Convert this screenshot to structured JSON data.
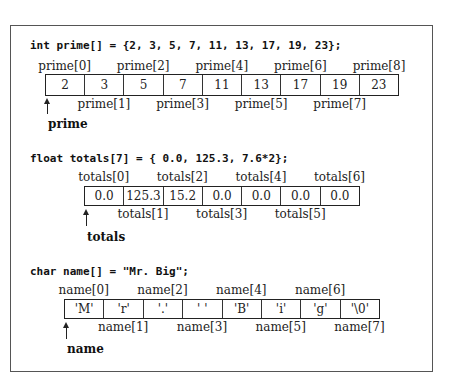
{
  "figure": {
    "sections": [
      {
        "code": "int prime[] = {2, 3, 5, 7, 11, 13, 17, 19, 23};",
        "pointer_name": "prime",
        "values": [
          "2",
          "3",
          "5",
          "7",
          "11",
          "13",
          "17",
          "19",
          "23"
        ],
        "labels": [
          "prime[0]",
          "prime[1]",
          "prime[2]",
          "prime[3]",
          "prime[4]",
          "prime[5]",
          "prime[6]",
          "prime[7]",
          "prime[8]"
        ]
      },
      {
        "code": "float totals[7] = { 0.0, 125.3, 7.6*2};",
        "pointer_name": "totals",
        "values": [
          "0.0",
          "125.3",
          "15.2",
          "0.0",
          "0.0",
          "0.0",
          "0.0"
        ],
        "labels": [
          "totals[0]",
          "totals[1]",
          "totals[2]",
          "totals[3]",
          "totals[4]",
          "totals[5]",
          "totals[6]"
        ]
      },
      {
        "code": "char name[] = \"Mr. Big\";",
        "pointer_name": "name",
        "values": [
          "'M'",
          "'r'",
          "'.'",
          "' '",
          "'B'",
          "'i'",
          "'g'",
          "'\\0'"
        ],
        "labels": [
          "name[0]",
          "name[1]",
          "name[2]",
          "name[3]",
          "name[4]",
          "name[5]",
          "name[6]",
          "name[7]"
        ]
      }
    ]
  }
}
